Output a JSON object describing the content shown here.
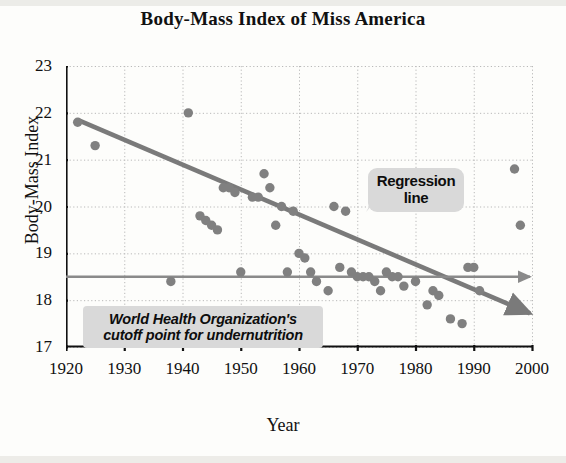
{
  "figure": {
    "title": "Body-Mass Index of Miss America",
    "colors": {
      "background": "#fdfdfb",
      "axis": "#111111",
      "grid": "#b9b9b9",
      "point": "#808080",
      "regression_line": "#7a7a7a",
      "who_line": "#8a8a8a",
      "callout_background": "#d9d9d9",
      "text": "#111111"
    }
  },
  "annotations": {
    "regression": {
      "line1": "Regression",
      "line2": "line"
    },
    "who": {
      "line1": "World Health Organization's",
      "line2": "cutoff point for undernutrition"
    }
  },
  "chart_data": {
    "type": "scatter",
    "title": "Body-Mass Index of Miss America",
    "xlabel": "Year",
    "ylabel": "Body-Mass Index",
    "xlim": [
      1920,
      2000
    ],
    "ylim": [
      17,
      23
    ],
    "xticks": [
      1920,
      1930,
      1940,
      1950,
      1960,
      1970,
      1980,
      1990,
      2000
    ],
    "yticks": [
      17,
      18,
      19,
      20,
      21,
      22,
      23
    ],
    "grid": true,
    "legend": "none",
    "points": [
      {
        "x": 1922,
        "y": 21.8
      },
      {
        "x": 1925,
        "y": 21.3
      },
      {
        "x": 1938,
        "y": 18.4
      },
      {
        "x": 1941,
        "y": 22.0
      },
      {
        "x": 1943,
        "y": 19.8
      },
      {
        "x": 1944,
        "y": 19.7
      },
      {
        "x": 1945,
        "y": 19.6
      },
      {
        "x": 1946,
        "y": 19.5
      },
      {
        "x": 1947,
        "y": 20.4
      },
      {
        "x": 1948,
        "y": 20.4
      },
      {
        "x": 1949,
        "y": 20.3
      },
      {
        "x": 1950,
        "y": 18.6
      },
      {
        "x": 1952,
        "y": 20.2
      },
      {
        "x": 1953,
        "y": 20.2
      },
      {
        "x": 1954,
        "y": 20.7
      },
      {
        "x": 1955,
        "y": 20.4
      },
      {
        "x": 1956,
        "y": 19.6
      },
      {
        "x": 1957,
        "y": 20.0
      },
      {
        "x": 1958,
        "y": 18.6
      },
      {
        "x": 1959,
        "y": 19.9
      },
      {
        "x": 1960,
        "y": 19.0
      },
      {
        "x": 1961,
        "y": 18.9
      },
      {
        "x": 1962,
        "y": 18.6
      },
      {
        "x": 1963,
        "y": 18.4
      },
      {
        "x": 1965,
        "y": 18.2
      },
      {
        "x": 1966,
        "y": 20.0
      },
      {
        "x": 1967,
        "y": 18.7
      },
      {
        "x": 1968,
        "y": 19.9
      },
      {
        "x": 1969,
        "y": 18.6
      },
      {
        "x": 1970,
        "y": 18.5
      },
      {
        "x": 1971,
        "y": 18.5
      },
      {
        "x": 1972,
        "y": 18.5
      },
      {
        "x": 1973,
        "y": 18.4
      },
      {
        "x": 1974,
        "y": 18.2
      },
      {
        "x": 1975,
        "y": 18.6
      },
      {
        "x": 1976,
        "y": 18.5
      },
      {
        "x": 1977,
        "y": 18.5
      },
      {
        "x": 1978,
        "y": 18.3
      },
      {
        "x": 1980,
        "y": 18.4
      },
      {
        "x": 1982,
        "y": 17.9
      },
      {
        "x": 1983,
        "y": 18.2
      },
      {
        "x": 1984,
        "y": 18.1
      },
      {
        "x": 1985,
        "y": 16.8
      },
      {
        "x": 1986,
        "y": 17.6
      },
      {
        "x": 1988,
        "y": 17.5
      },
      {
        "x": 1989,
        "y": 18.7
      },
      {
        "x": 1990,
        "y": 18.7
      },
      {
        "x": 1991,
        "y": 18.2
      },
      {
        "x": 1997,
        "y": 20.8
      },
      {
        "x": 1998,
        "y": 19.6
      }
    ],
    "lines": [
      {
        "name": "regression-line",
        "label": "Regression line",
        "x0": 1922,
        "y0": 21.85,
        "x1": 2000,
        "y1": 17.72,
        "arrow": true
      },
      {
        "name": "who-cutoff-line",
        "label": "World Health Organization's cutoff point for undernutrition",
        "x0": 1920,
        "y0": 18.5,
        "x1": 2000,
        "y1": 18.5,
        "arrow": true
      }
    ]
  }
}
